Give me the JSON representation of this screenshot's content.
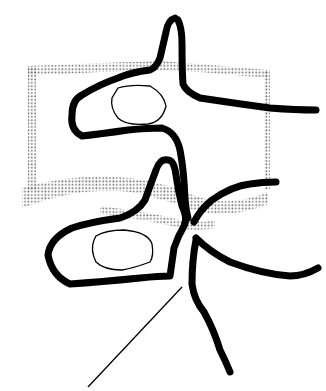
{
  "diagram": {
    "type": "anatomical-sketch",
    "colors": {
      "background": "#ffffff",
      "stroke": "#000000",
      "stipple": "#6e6e6e"
    },
    "elements": [
      {
        "name": "upper-vertebra-body-stipple",
        "kind": "dotted-outline"
      },
      {
        "name": "lower-vertebra-body-stipple",
        "kind": "dotted-outline"
      },
      {
        "name": "upper-vertebra-outline",
        "kind": "thick-stroke"
      },
      {
        "name": "upper-pedicle-oval",
        "kind": "thin-stroke"
      },
      {
        "name": "lower-vertebra-outline",
        "kind": "thick-stroke"
      },
      {
        "name": "lower-pedicle-oval",
        "kind": "thin-stroke"
      },
      {
        "name": "nerve-root-branches",
        "kind": "thick-stroke"
      },
      {
        "name": "pointer-line",
        "kind": "thin-stroke"
      }
    ],
    "labels": []
  }
}
